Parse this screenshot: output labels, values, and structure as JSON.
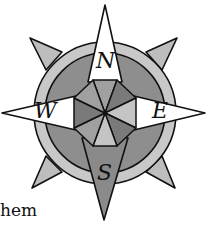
{
  "figure": {
    "type": "compass-rose",
    "directions": {
      "north": "N",
      "east": "E",
      "south": "S",
      "west": "W"
    },
    "colors": {
      "outline": "#111111",
      "ring_outer": "#c8c8c8",
      "ring_inner": "#8e8e8e",
      "spike": "#bdbdbd",
      "north_point": "#ffffff",
      "east_point": "#ffffff",
      "west_point": "#ffffff",
      "south_point": "#8a8a8a",
      "oct_dark": "#7a7a7a",
      "oct_mid": "#a0a0a0",
      "oct_light": "#c4c4c4"
    }
  },
  "caption": {
    "text": "hem"
  }
}
